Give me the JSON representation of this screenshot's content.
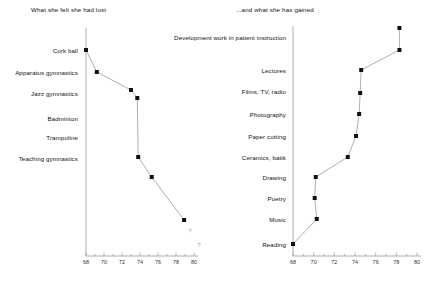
{
  "figure": {
    "background": "#ffffff",
    "marker_color": "#111111",
    "line_color": "#9a9a9a",
    "axis_color": "#9a9a9a"
  },
  "panels": {
    "lost": {
      "title": "What she felt she had lost",
      "uncertainty_marks": [
        "?",
        "?"
      ]
    },
    "gained": {
      "title": "...and what she has gained"
    }
  },
  "chart_data": [
    {
      "type": "scatter",
      "title": "What she felt she had lost",
      "xlabel": "",
      "ylabel": "",
      "xlim": [
        68,
        80
      ],
      "ylim_categories": [
        "Cork ball",
        "Apparatus gymnastics",
        "Jazz gymnastics",
        "Badminton",
        "Trampoline",
        "Teaching gymnastics"
      ],
      "xticks": [
        68,
        70,
        72,
        74,
        76,
        78,
        80
      ],
      "xticklabels": [
        "68",
        "70",
        "72",
        "74",
        "76",
        "78",
        "80"
      ],
      "grid": false,
      "legend": "none",
      "connected": true,
      "points": [
        {
          "label": "Cork ball",
          "x": 68.0,
          "y_px": 50
        },
        {
          "label": "Apparatus gymnastics",
          "x": 69.2,
          "y_px": 72
        },
        {
          "label": "Jazz gymnastics",
          "x": 73.0,
          "y_px": 90
        },
        {
          "label": "",
          "x": 73.7,
          "y_px": 98
        },
        {
          "label": "Teaching gymnastics",
          "x": 73.8,
          "y_px": 157
        },
        {
          "label": "",
          "x": 75.3,
          "y_px": 177
        },
        {
          "label": "",
          "x": 78.9,
          "y_px": 220
        }
      ],
      "annotations": [
        {
          "text": "?",
          "x": 79.6,
          "y_px": 232
        },
        {
          "text": "?",
          "x": 80.6,
          "y_px": 246
        }
      ]
    },
    {
      "type": "scatter",
      "title": "...and what she has gained",
      "xlabel": "",
      "ylabel": "",
      "xlim": [
        68,
        80
      ],
      "ylim_categories": [
        "Development work in patient instruction",
        "Lectures",
        "Films, TV, radio",
        "Photography",
        "Paper cutting",
        "Ceramics, batik",
        "Drawing",
        "Poetry",
        "Music",
        "Reading"
      ],
      "xticks": [
        68,
        70,
        72,
        74,
        76,
        78,
        80
      ],
      "xticklabels": [
        "68",
        "70",
        "72",
        "74",
        "76",
        "78",
        "80"
      ],
      "grid": false,
      "legend": "none",
      "connected": true,
      "points": [
        {
          "label": "",
          "x": 78.3,
          "y_px": 28
        },
        {
          "label": "Development work in patient instruction",
          "x": 78.3,
          "y_px": 50
        },
        {
          "label": "Lectures",
          "x": 74.6,
          "y_px": 70
        },
        {
          "label": "Films, TV, radio",
          "x": 74.5,
          "y_px": 93
        },
        {
          "label": "Photography",
          "x": 74.4,
          "y_px": 114
        },
        {
          "label": "Paper cutting",
          "x": 74.1,
          "y_px": 136
        },
        {
          "label": "Ceramics, batik",
          "x": 73.3,
          "y_px": 157
        },
        {
          "label": "Drawing",
          "x": 70.2,
          "y_px": 177
        },
        {
          "label": "Poetry",
          "x": 70.1,
          "y_px": 198
        },
        {
          "label": "Music",
          "x": 70.3,
          "y_px": 219
        },
        {
          "label": "Reading",
          "x": 68.0,
          "y_px": 244
        }
      ]
    }
  ],
  "labels": {
    "lost": [
      {
        "text": "Cork ball",
        "top": 47,
        "right_edge": 78
      },
      {
        "text": "Apparatus gymnastics",
        "top": 69,
        "right_edge": 78
      },
      {
        "text": "Jazz gymnastics",
        "top": 90,
        "right_edge": 78
      },
      {
        "text": "Badminton",
        "top": 115,
        "right_edge": 78
      },
      {
        "text": "Trampoline",
        "top": 134,
        "right_edge": 78
      },
      {
        "text": "Teaching gymnastics",
        "top": 155,
        "right_edge": 78
      }
    ],
    "gained": [
      {
        "text": "Development work in patient instruction",
        "top": 34,
        "right_edge": 286
      },
      {
        "text": "Lectures",
        "top": 67,
        "right_edge": 286
      },
      {
        "text": "Films, TV, radio",
        "top": 88,
        "right_edge": 286
      },
      {
        "text": "Photography",
        "top": 111,
        "right_edge": 286
      },
      {
        "text": "Paper cutting",
        "top": 133,
        "right_edge": 286
      },
      {
        "text": "Ceramics, batik",
        "top": 154,
        "right_edge": 286
      },
      {
        "text": "Drawing",
        "top": 174,
        "right_edge": 286
      },
      {
        "text": "Poetry",
        "top": 195,
        "right_edge": 286
      },
      {
        "text": "Music",
        "top": 216,
        "right_edge": 286
      },
      {
        "text": "Reading",
        "top": 241,
        "right_edge": 286
      }
    ]
  },
  "axes": {
    "lost": {
      "x0_px": 86,
      "x1_px": 194,
      "y_px": 256,
      "x0_val": 68,
      "x1_val": 80
    },
    "gained": {
      "x0_px": 293,
      "x1_px": 417,
      "y_px": 256,
      "x0_val": 68,
      "x1_val": 80
    }
  }
}
